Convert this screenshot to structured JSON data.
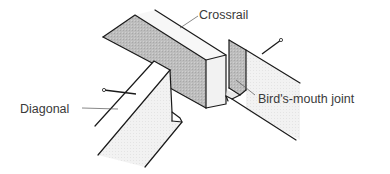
{
  "figure": {
    "labels": {
      "crossrail": "Crossrail",
      "diagonal": "Diagonal",
      "birds_mouth": "Bird's-mouth joint"
    },
    "colors": {
      "background": "#ffffff",
      "outline": "#1a1a1a",
      "shaded_face": "#b8b8b8",
      "light_face": "#f0f0f0",
      "mid_face": "#dcdcdc",
      "label_text": "#3a3a3a"
    }
  }
}
